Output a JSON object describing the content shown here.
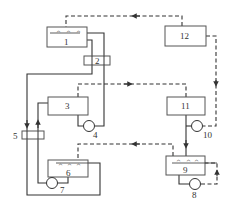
{
  "diagram": {
    "type": "process-flow-schematic",
    "components": [
      {
        "id": "1",
        "label": "1",
        "kind": "spray-chamber"
      },
      {
        "id": "2",
        "label": "2",
        "kind": "heat-exchanger"
      },
      {
        "id": "3",
        "label": "3",
        "kind": "tank"
      },
      {
        "id": "4",
        "label": "4",
        "kind": "pump"
      },
      {
        "id": "5",
        "label": "5",
        "kind": "heat-exchanger"
      },
      {
        "id": "6",
        "label": "6",
        "kind": "spray-chamber"
      },
      {
        "id": "7",
        "label": "7",
        "kind": "pump"
      },
      {
        "id": "8",
        "label": "8",
        "kind": "pump"
      },
      {
        "id": "9",
        "label": "9",
        "kind": "spray-chamber"
      },
      {
        "id": "10",
        "label": "10",
        "kind": "pump"
      },
      {
        "id": "11",
        "label": "11",
        "kind": "tank"
      },
      {
        "id": "12",
        "label": "12",
        "kind": "unit"
      }
    ],
    "flows": [
      {
        "from": "12",
        "to": "1",
        "style": "dashed"
      },
      {
        "from": "12",
        "to": "10",
        "style": "dashed"
      },
      {
        "from": "3",
        "to": "11",
        "style": "dashed"
      },
      {
        "from": "9",
        "to": "6",
        "style": "dashed"
      },
      {
        "from": "8",
        "to": "9",
        "style": "dashed"
      },
      {
        "from": "1",
        "to": "2",
        "style": "solid"
      },
      {
        "from": "2",
        "to": "5",
        "style": "solid"
      },
      {
        "from": "6",
        "to": "7",
        "style": "solid"
      },
      {
        "from": "7",
        "to": "5",
        "style": "solid"
      },
      {
        "from": "5",
        "to": "3",
        "style": "solid"
      },
      {
        "from": "3",
        "to": "4",
        "style": "solid"
      },
      {
        "from": "4",
        "to": "1",
        "style": "solid"
      },
      {
        "from": "11",
        "to": "9",
        "style": "solid"
      }
    ],
    "nozzle_glyph": "^"
  }
}
